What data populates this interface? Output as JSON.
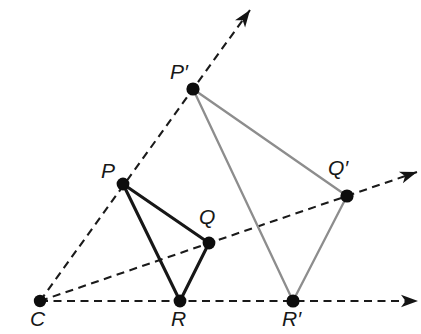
{
  "figure": {
    "type": "geometry-dilation-diagram",
    "canvas": {
      "width": 421,
      "height": 334,
      "background": "#ffffff"
    },
    "colors": {
      "preimage_stroke": "#171717",
      "image_stroke": "#8d8d8d",
      "ray_stroke": "#1a1a1a",
      "vertex_fill": "#0d0d0d",
      "label_color": "#171717"
    },
    "center": {
      "id": "C",
      "label": "C",
      "x": 40,
      "y": 301,
      "label_x": 30,
      "label_y": 308,
      "dot_r": 6.2
    },
    "preimage": {
      "name": "triangle-pqr",
      "stroke": "#171717",
      "vertices": [
        {
          "id": "P",
          "label": "P",
          "x": 123,
          "y": 184,
          "label_x": 101,
          "label_y": 160,
          "dot_r": 6.4
        },
        {
          "id": "Q",
          "label": "Q",
          "x": 209,
          "y": 243,
          "label_x": 199,
          "label_y": 206,
          "dot_r": 6.4
        },
        {
          "id": "R",
          "label": "R",
          "x": 180,
          "y": 301,
          "label_x": 171,
          "label_y": 308,
          "dot_r": 6.4
        }
      ]
    },
    "image": {
      "name": "triangle-p-prime-q-prime-r-prime",
      "stroke": "#8d8d8d",
      "vertices": [
        {
          "id": "Pp",
          "label": "P′",
          "x": 193,
          "y": 89,
          "label_x": 170,
          "label_y": 61,
          "dot_r": 6.6
        },
        {
          "id": "Qp",
          "label": "Q′",
          "x": 347,
          "y": 196,
          "label_x": 328,
          "label_y": 157,
          "dot_r": 6.6
        },
        {
          "id": "Rp",
          "label": "R′",
          "x": 293,
          "y": 301,
          "label_x": 282,
          "label_y": 308,
          "dot_r": 6.6
        }
      ]
    },
    "rays": [
      {
        "id": "ray-c-p-pprime",
        "label": "ray through P and P prime",
        "x1": 40,
        "y1": 301,
        "x2": 250,
        "y2": 10
      },
      {
        "id": "ray-c-q-qprime",
        "label": "ray through Q and Q prime",
        "x1": 40,
        "y1": 301,
        "x2": 417,
        "y2": 172
      },
      {
        "id": "ray-c-r-rprime",
        "label": "ray through R and R prime",
        "x1": 40,
        "y1": 301,
        "x2": 418,
        "y2": 301
      }
    ]
  }
}
